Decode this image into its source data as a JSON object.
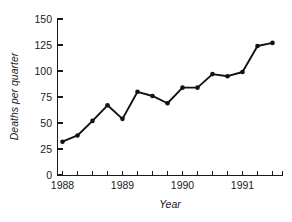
{
  "chart_data": {
    "type": "line",
    "title": "",
    "subtitle": "",
    "xlabel": "Year",
    "ylabel": "Deaths per quarter",
    "xlim": [
      1988.0,
      1991.75
    ],
    "ylim": [
      0,
      150
    ],
    "grid": false,
    "legend": null,
    "y_ticks": [
      0,
      25,
      50,
      75,
      100,
      125,
      150
    ],
    "y_tick_labels": [
      "0",
      "25",
      "50",
      "75",
      "100",
      "125",
      "150"
    ],
    "x_ticks": [
      1988.0,
      1988.25,
      1988.5,
      1988.75,
      1989.0,
      1989.25,
      1989.5,
      1989.75,
      1990.0,
      1990.25,
      1990.5,
      1990.75,
      1991.0,
      1991.25,
      1991.5,
      1991.75
    ],
    "x_major_ticks": [
      1988,
      1989,
      1990,
      1991
    ],
    "x_tick_labels": [
      "1988",
      "1989",
      "1990",
      "1991"
    ],
    "x_tick_interval_label": "quarterly",
    "marker": "filled-circle",
    "line_color": "#111111",
    "marker_color": "#111111",
    "axis_color": "#1a1a1a",
    "background_color": "#ffffff",
    "x": [
      1988.0,
      1988.25,
      1988.5,
      1988.75,
      1989.0,
      1989.25,
      1989.5,
      1989.75,
      1990.0,
      1990.25,
      1990.5,
      1990.75,
      1991.0,
      1991.25,
      1991.5
    ],
    "x_quarter_labels": [
      "1988 Q1",
      "1988 Q2",
      "1988 Q3",
      "1988 Q4",
      "1989 Q1",
      "1989 Q2",
      "1989 Q3",
      "1989 Q4",
      "1990 Q1",
      "1990 Q2",
      "1990 Q3",
      "1990 Q4",
      "1991 Q1",
      "1991 Q2",
      "1991 Q3"
    ],
    "values": [
      32,
      38,
      52,
      67,
      54,
      80,
      76,
      69,
      84,
      84,
      97,
      95,
      99,
      124,
      127
    ],
    "series": [
      {
        "name": "Deaths per quarter",
        "values": [
          32,
          38,
          52,
          67,
          54,
          80,
          76,
          69,
          84,
          84,
          97,
          95,
          99,
          124,
          127
        ]
      }
    ]
  },
  "axes": {
    "y_title": "Deaths per quarter",
    "x_title": "Year"
  }
}
